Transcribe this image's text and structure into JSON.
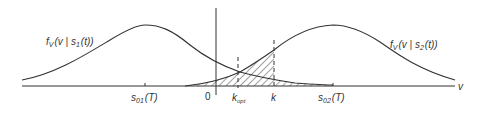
{
  "figure": {
    "curve_left_label": {
      "f": "f",
      "sub": "V",
      "rest1": "(v | s",
      "sub2": "1",
      "rest2": "(t))"
    },
    "curve_right_label": {
      "f": "f",
      "sub": "V",
      "rest1": "(v | s",
      "sub2": "2",
      "rest2": "(t))"
    },
    "axis_label": "v",
    "origin_label": "0",
    "s01_label": {
      "main": "s",
      "sub": "01",
      "rest": "(T)"
    },
    "s02_label": {
      "main": "s",
      "sub": "02",
      "rest": "(T)"
    },
    "kopt_label": {
      "main": "k",
      "sub": "opt"
    },
    "k_label": "k"
  },
  "colors": {
    "line": "#333333",
    "hatch": "#444444",
    "background": "#ffffff"
  }
}
